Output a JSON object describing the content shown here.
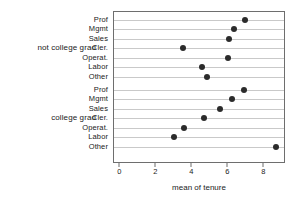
{
  "chart_data": {
    "type": "scatter",
    "title": "",
    "subtitle": "",
    "xlabel": "mean of tenure",
    "ylabel": "",
    "xlim": [
      -0.35,
      9.2
    ],
    "xticks": [
      0,
      2,
      4,
      6,
      8
    ],
    "xticklabels": [
      "0",
      "2",
      "4",
      "6",
      "8"
    ],
    "grid": "horizontal",
    "legend": "none",
    "panel_label_position": "left",
    "marker": "filled-circle",
    "marker_color": "#2b2b2b",
    "panels": [
      {
        "label": "not college grad",
        "categories": [
          "Prof",
          "Mgmt",
          "Sales",
          "Cler.",
          "Operat.",
          "Labor",
          "Other"
        ],
        "values": [
          6.9,
          6.3,
          6.05,
          3.5,
          6.0,
          4.55,
          4.8
        ]
      },
      {
        "label": "college grad",
        "categories": [
          "Prof",
          "Mgmt",
          "Sales",
          "Cler.",
          "Operat.",
          "Labor",
          "Other"
        ],
        "values": [
          6.85,
          6.2,
          5.55,
          4.65,
          3.55,
          3.0,
          8.65
        ]
      }
    ]
  }
}
